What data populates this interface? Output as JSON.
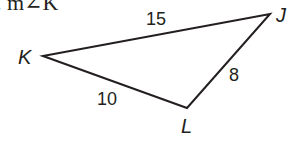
{
  "problem": {
    "prompt": ". m∠K"
  },
  "triangle": {
    "vertices": [
      {
        "label": "K",
        "x": 43,
        "y": 56
      },
      {
        "label": "J",
        "x": 270,
        "y": 14
      },
      {
        "label": "L",
        "x": 187,
        "y": 108
      }
    ],
    "sides": [
      {
        "between": "KJ",
        "length": "15"
      },
      {
        "between": "JL",
        "length": "8"
      },
      {
        "between": "KL",
        "length": "10"
      }
    ],
    "stroke_color": "#231f20"
  }
}
